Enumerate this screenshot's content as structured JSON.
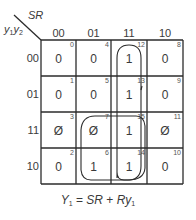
{
  "kmap": {
    "column_variable": "SR",
    "row_variable_1": "y",
    "row_variable_1_sub": "1",
    "row_variable_2": "y",
    "row_variable_2_sub": "2",
    "column_headers": [
      "00",
      "01",
      "11",
      "10"
    ],
    "row_headers": [
      "00",
      "01",
      "11",
      "10"
    ],
    "cells": [
      [
        {
          "value": "0",
          "index": "0"
        },
        {
          "value": "0",
          "index": "4"
        },
        {
          "value": "1",
          "index": "12"
        },
        {
          "value": "0",
          "index": "8"
        }
      ],
      [
        {
          "value": "0",
          "index": "1"
        },
        {
          "value": "0",
          "index": "5"
        },
        {
          "value": "1",
          "index": "13"
        },
        {
          "value": "0",
          "index": "9"
        }
      ],
      [
        {
          "value": "Ø",
          "index": "3"
        },
        {
          "value": "Ø",
          "index": "7"
        },
        {
          "value": "1",
          "index": "15"
        },
        {
          "value": "Ø",
          "index": "11"
        }
      ],
      [
        {
          "value": "0",
          "index": "2"
        },
        {
          "value": "1",
          "index": "6"
        },
        {
          "value": "1",
          "index": "14"
        },
        {
          "value": "0",
          "index": "10"
        }
      ]
    ],
    "loops": [
      {
        "name": "SR",
        "cells": [
          "12",
          "13",
          "15",
          "14"
        ]
      },
      {
        "name": "Ry1",
        "cells": [
          "7",
          "15",
          "6",
          "14"
        ]
      }
    ]
  },
  "equation": {
    "lhs": "Y",
    "lhs_sub": "1",
    "eq": " = ",
    "term1": "SR",
    "plus": " + ",
    "term2": "Ry",
    "term2_sub": "1"
  }
}
